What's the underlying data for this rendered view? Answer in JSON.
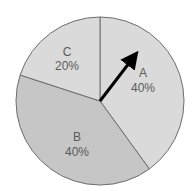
{
  "chart_data": {
    "type": "pie",
    "title": "",
    "categories": [
      "A",
      "B",
      "C"
    ],
    "values": [
      40,
      40,
      20
    ],
    "labels": [
      "40%",
      "40%",
      "20%"
    ],
    "start_angle": "12 o'clock",
    "direction": "clockwise",
    "colors": {
      "A": "#dadada",
      "B": "#c6c6c6",
      "C": "#dadada"
    },
    "legend": "none",
    "annotations": [
      {
        "type": "arrow",
        "from": "center",
        "toward": "slice A",
        "color": "#000000"
      }
    ]
  },
  "slices": [
    {
      "name": "A",
      "pct": "40%",
      "color": "#dadada"
    },
    {
      "name": "B",
      "pct": "40%",
      "color": "#c6c6c6"
    },
    {
      "name": "C",
      "pct": "20%",
      "color": "#dadada"
    }
  ]
}
